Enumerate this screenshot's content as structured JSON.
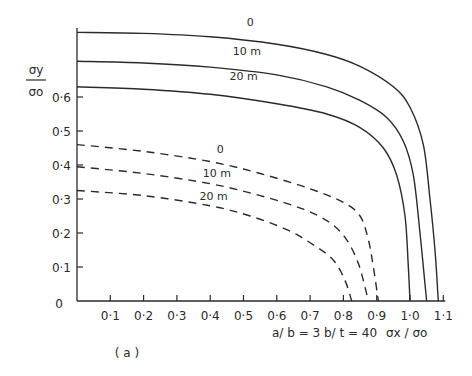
{
  "chart_data": {
    "type": "line",
    "title": "",
    "panel_label": "( a )",
    "xlabel": "σx / σo",
    "ylabel_num": "σy",
    "ylabel_den": "σo",
    "parameters_note": "a/ b = 3    b/ t = 40",
    "xlim": [
      0,
      1.1
    ],
    "ylim": [
      0,
      0.8
    ],
    "x_ticks": [
      "0·1",
      "0·2",
      "0·3",
      "0·4",
      "0·5",
      "0·6",
      "0·7",
      "0·8",
      "0·9",
      "1·0",
      "1·1"
    ],
    "x_tick_values": [
      0.1,
      0.2,
      0.3,
      0.4,
      0.5,
      0.6,
      0.7,
      0.8,
      0.9,
      1.0,
      1.1
    ],
    "y_ticks": [
      "0",
      "0·1",
      "0·2",
      "0·3",
      "0·4",
      "0·5",
      "0·6"
    ],
    "y_tick_values": [
      0,
      0.1,
      0.2,
      0.3,
      0.4,
      0.5,
      0.6
    ],
    "grid": false,
    "series": [
      {
        "name": "0",
        "style": "solid",
        "label": "0",
        "points": [
          [
            0,
            0.79
          ],
          [
            0.2,
            0.787
          ],
          [
            0.4,
            0.777
          ],
          [
            0.6,
            0.755
          ],
          [
            0.75,
            0.725
          ],
          [
            0.85,
            0.69
          ],
          [
            0.95,
            0.63
          ],
          [
            1.0,
            0.57
          ],
          [
            1.04,
            0.46
          ],
          [
            1.06,
            0.3
          ],
          [
            1.075,
            0.15
          ],
          [
            1.085,
            0
          ]
        ]
      },
      {
        "name": "10 m",
        "style": "solid",
        "label": "10 m",
        "points": [
          [
            0,
            0.705
          ],
          [
            0.2,
            0.7
          ],
          [
            0.4,
            0.688
          ],
          [
            0.6,
            0.665
          ],
          [
            0.75,
            0.63
          ],
          [
            0.85,
            0.59
          ],
          [
            0.93,
            0.54
          ],
          [
            0.98,
            0.47
          ],
          [
            1.01,
            0.37
          ],
          [
            1.03,
            0.2
          ],
          [
            1.045,
            0.05
          ],
          [
            1.05,
            0
          ]
        ]
      },
      {
        "name": "20 m",
        "style": "solid",
        "label": "20 m",
        "points": [
          [
            0,
            0.63
          ],
          [
            0.2,
            0.623
          ],
          [
            0.4,
            0.608
          ],
          [
            0.6,
            0.58
          ],
          [
            0.75,
            0.55
          ],
          [
            0.85,
            0.51
          ],
          [
            0.92,
            0.45
          ],
          [
            0.96,
            0.37
          ],
          [
            0.985,
            0.25
          ],
          [
            0.995,
            0.1
          ],
          [
            1.0,
            0
          ]
        ]
      },
      {
        "name": "0",
        "style": "dashed",
        "label": "0",
        "points": [
          [
            0,
            0.46
          ],
          [
            0.2,
            0.44
          ],
          [
            0.4,
            0.41
          ],
          [
            0.55,
            0.375
          ],
          [
            0.7,
            0.33
          ],
          [
            0.8,
            0.29
          ],
          [
            0.85,
            0.25
          ],
          [
            0.875,
            0.18
          ],
          [
            0.89,
            0.1
          ],
          [
            0.905,
            0
          ]
        ]
      },
      {
        "name": "10 m",
        "style": "dashed",
        "label": "10 m",
        "points": [
          [
            0,
            0.395
          ],
          [
            0.2,
            0.375
          ],
          [
            0.4,
            0.345
          ],
          [
            0.55,
            0.31
          ],
          [
            0.68,
            0.27
          ],
          [
            0.76,
            0.23
          ],
          [
            0.81,
            0.18
          ],
          [
            0.845,
            0.11
          ],
          [
            0.865,
            0.04
          ],
          [
            0.875,
            0
          ]
        ]
      },
      {
        "name": "20 m",
        "style": "dashed",
        "label": "20 m",
        "points": [
          [
            0,
            0.325
          ],
          [
            0.2,
            0.31
          ],
          [
            0.4,
            0.28
          ],
          [
            0.52,
            0.25
          ],
          [
            0.63,
            0.21
          ],
          [
            0.71,
            0.165
          ],
          [
            0.77,
            0.12
          ],
          [
            0.805,
            0.06
          ],
          [
            0.825,
            0
          ]
        ]
      }
    ],
    "annotations": [
      {
        "text": "0",
        "x": 0.52,
        "y": 0.81
      },
      {
        "text": "10 m",
        "x": 0.51,
        "y": 0.725
      },
      {
        "text": "20 m",
        "x": 0.5,
        "y": 0.65
      },
      {
        "text": "0",
        "x": 0.43,
        "y": 0.435
      },
      {
        "text": "10 m",
        "x": 0.42,
        "y": 0.365
      },
      {
        "text": "20 m",
        "x": 0.41,
        "y": 0.298
      }
    ]
  }
}
